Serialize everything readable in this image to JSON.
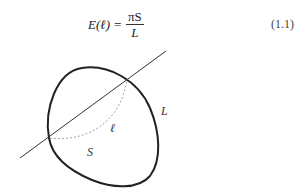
{
  "equation": {
    "lhs": "E(ℓ) =",
    "lhs_func": "E",
    "lhs_arg": "ℓ",
    "numerator": "πS",
    "denominator": "L",
    "number": "(1.1)"
  },
  "figure": {
    "labels": {
      "perimeter": "L",
      "chord_arc": "ℓ",
      "area": "S"
    }
  }
}
